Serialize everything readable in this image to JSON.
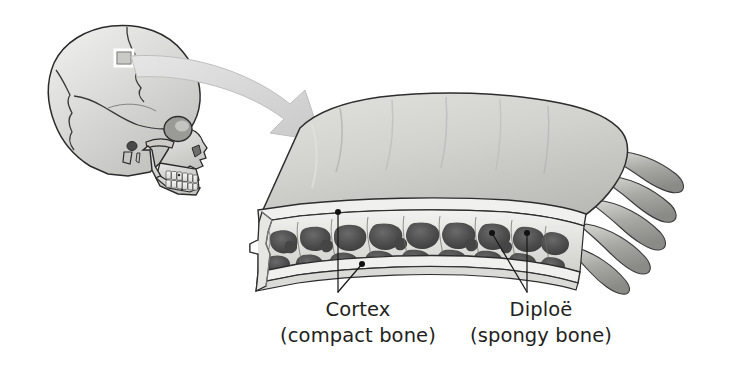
{
  "figure": {
    "background_color": "#ffffff"
  },
  "skull": {
    "name": "lateral skull view",
    "highlight_box_label": "sample site",
    "bone_fill": "#d5d5d3",
    "outline_color": "#2b2b2b",
    "suture_color": "#3a3a3a",
    "highlight_color": "#ffffff"
  },
  "arrow": {
    "name": "magnification arrow",
    "fill": "#d9d9d9",
    "stroke": "#b4b4b4"
  },
  "specimen": {
    "name": "skull bone wedge",
    "outer_table_fill": "#cfcfcc",
    "cut_face_fill": "#e8e8e6",
    "marrow_fill": "#4f4f4f",
    "trabecula_fill": "#e4e4e1",
    "outline_color": "#2d2d2d"
  },
  "labels": [
    {
      "id": "cortex",
      "title": "Cortex",
      "subtitle": "(compact bone)",
      "title_x": 358,
      "title_y": 316,
      "subtitle_x": 358,
      "subtitle_y": 342,
      "color": "#231f20"
    },
    {
      "id": "diploe",
      "title": "Diploë",
      "subtitle": "(spongy bone)",
      "title_x": 541,
      "title_y": 316,
      "subtitle_x": 541,
      "subtitle_y": 342,
      "color": "#231f20"
    }
  ]
}
